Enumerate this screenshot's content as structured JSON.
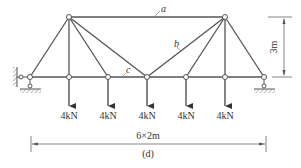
{
  "figure": {
    "caption": "(d)",
    "member_labels": {
      "a": "a",
      "b": "b",
      "c": "c"
    },
    "loads": [
      {
        "label": "4kN",
        "node_x": 69
      },
      {
        "label": "4kN",
        "node_x": 108
      },
      {
        "label": "4kN",
        "node_x": 147
      },
      {
        "label": "4kN",
        "node_x": 186
      },
      {
        "label": "4kN",
        "node_x": 225
      }
    ],
    "height_dimension": "3m",
    "span_dimension": "6×2m",
    "supports": {
      "left": "pin",
      "right": "roller"
    },
    "colors": {
      "member": "#555555",
      "text": "#333333",
      "dimension": "#666666"
    }
  }
}
